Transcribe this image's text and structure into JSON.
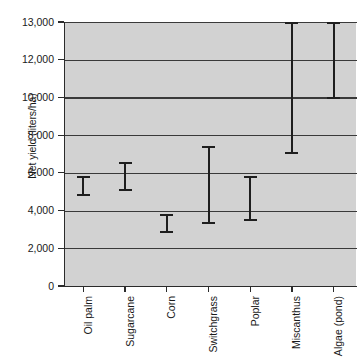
{
  "chart_data": {
    "type": "errorbar",
    "title": "",
    "xlabel": "",
    "ylabel": "Net yield (liters/ha)",
    "categories": [
      "Oil palm",
      "Sugarcane",
      "Corn",
      "Switchgrass",
      "Poplar",
      "Miscanthus",
      "Algae (pond)"
    ],
    "series": [
      {
        "name": "Net yield range",
        "low": [
          4750,
          5050,
          2800,
          3300,
          3450,
          7000,
          9900
        ],
        "high": [
          5850,
          6550,
          3800,
          7400,
          5850,
          13000,
          13000
        ]
      }
    ],
    "ytick_labels": [
      "0",
      "2,000",
      "4,000",
      "6,000",
      "8,000",
      "10,000",
      "12,000",
      "13,000"
    ],
    "ytick_values": [
      0,
      2000,
      4000,
      6000,
      8000,
      10000,
      12000,
      13000
    ],
    "ylim": [
      0,
      13000
    ],
    "axis_note": "top segment 12,000-13,000 uses same spacing as 2,000 intervals (compressed/broken axis)",
    "grid": "horizontal",
    "legend": "none",
    "plot_background": "#d2d2d2",
    "bar_color": "#1e1e1e",
    "gridline_color": "#3a3a3a"
  }
}
